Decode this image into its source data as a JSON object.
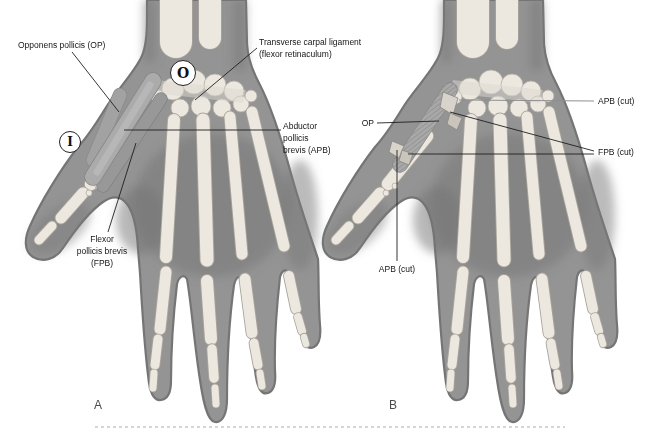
{
  "figure": {
    "panel_a": {
      "caption": "A",
      "labels": {
        "opponens": "Opponens pollicis (OP)",
        "transverse_carpal": "Transverse carpal ligament\n(flexor retinaculum)",
        "abductor": "Abductor\npollicis\nbrevis (APB)",
        "flexor": "Flexor\npollicis brevis\n(FPB)",
        "origin_marker": "O",
        "insertion_marker": "I"
      }
    },
    "panel_b": {
      "caption": "B",
      "labels": {
        "op": "OP",
        "apb_cut_top": "APB (cut)",
        "fpb_cut": "FPB (cut)",
        "apb_cut_bottom": "APB (cut)"
      }
    },
    "colors": {
      "background": "#ffffff",
      "skin": "#949494",
      "skin_outline": "#757575",
      "bone": "#ece8e0",
      "muscle": "#ababab",
      "cut_stub": "#d8d4cb",
      "leader_line": "#1f1f1f",
      "dashed_divider": "#b2a99e",
      "label_text": "#141414"
    }
  }
}
